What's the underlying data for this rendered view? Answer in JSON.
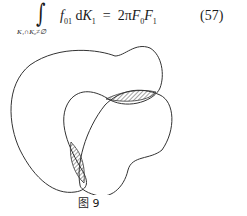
{
  "equation": {
    "integral_subscript": "K₁∩K₀≠∅",
    "integrand_f": "f",
    "integrand_f_sub": "01",
    "d": "d",
    "K": "K",
    "K_sub": "1",
    "equals": "=",
    "rhs_coeff": "2π",
    "F": "F",
    "F0_sub": "0",
    "F1_sub": "1",
    "number": "(57)"
  },
  "figure": {
    "caption": "图 9"
  }
}
